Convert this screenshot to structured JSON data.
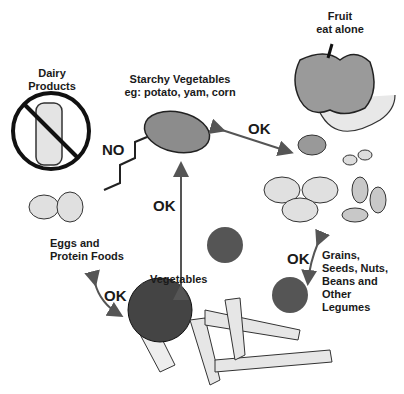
{
  "diagram": {
    "nodes": {
      "dairy": {
        "line1": "Dairy",
        "line2": "Products"
      },
      "starchy": {
        "line1": "Starchy Vegetables",
        "line2": "eg: potato, yam, corn"
      },
      "fruit": {
        "line1": "Fruit",
        "line2": "eat alone"
      },
      "eggs": {
        "line1": "Eggs and",
        "line2": "Protein Foods"
      },
      "vegetables": {
        "label": "Vegetables"
      },
      "grains": {
        "line1": "Grains,",
        "line2": "Seeds, Nuts,",
        "line3": "Beans and",
        "line4": "Other",
        "line5": "Legumes"
      }
    },
    "edges": {
      "protein_starchy": "NO",
      "starchy_vegetables": "OK",
      "starchy_grains": "OK",
      "vegetables_grains": "OK",
      "vegetables_protein": "OK"
    },
    "colors": {
      "ink": "#1a1a1a",
      "fill_gray": "#9a9a9a",
      "light_gray": "#d8d8d8",
      "arrow": "#555555"
    }
  }
}
